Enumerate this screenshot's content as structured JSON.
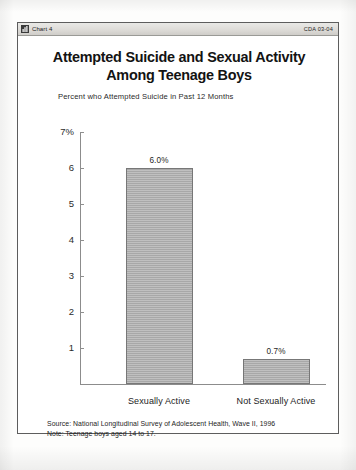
{
  "window": {
    "title": "Chart 4",
    "icon": "chart-icon",
    "document_id": "CDA 03-04"
  },
  "chart": {
    "title_line1": "Attempted Suicide and Sexual Activity",
    "title_line2": "Among Teenage Boys",
    "subtitle": "Percent who Attempted Suicide in Past 12 Months",
    "footnote_source": "Source: National Longitudinal Survey of Adolescent Health, Wave II, 1996",
    "footnote_note": "Note: Teenage boys aged 14 to 17.",
    "bar_color": "#a8a8a8",
    "axis_color": "#8c8c8c"
  },
  "chart_data": {
    "type": "bar",
    "title": "Attempted Suicide and Sexual Activity Among Teenage Boys",
    "subtitle": "Percent who Attempted Suicide in Past 12 Months",
    "categories": [
      "Sexually Active",
      "Not Sexually Active"
    ],
    "values": [
      6.0,
      0.7
    ],
    "data_labels": [
      "6.0%",
      "0.7%"
    ],
    "xlabel": "",
    "ylabel": "",
    "ylim": [
      0,
      7
    ],
    "yticks": [
      1,
      2,
      3,
      4,
      5,
      6,
      7
    ],
    "ytick_labels": [
      "1",
      "2",
      "3",
      "4",
      "5",
      "6",
      "7%"
    ],
    "grid": false,
    "legend": "none"
  }
}
